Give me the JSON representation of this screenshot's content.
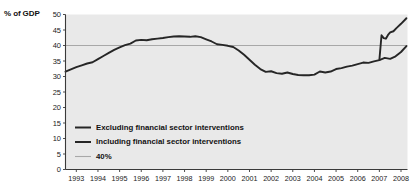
{
  "chart_data": {
    "type": "line",
    "title": "",
    "xlabel": "",
    "ylabel": "% of GDP",
    "ylim": [
      0,
      50
    ],
    "xlim": [
      1993,
      2008.8
    ],
    "grid": false,
    "legend_position": "inside-lower-left",
    "yticks": [
      0,
      5,
      10,
      15,
      20,
      25,
      30,
      35,
      40,
      45,
      50
    ],
    "categories": [
      "1993",
      "1994",
      "1995",
      "1996",
      "1997",
      "1998",
      "1999",
      "2000",
      "2001",
      "2002",
      "2003",
      "2004",
      "2005",
      "2006",
      "2007",
      "2008"
    ],
    "reference_line": {
      "label": "40%",
      "value": 40,
      "color": "#a8a8a8"
    },
    "series": [
      {
        "name": "Excluding financial sector interventions",
        "color": "#262626",
        "x": [
          1993.0,
          1993.25,
          1993.5,
          1993.75,
          1994.0,
          1994.25,
          1994.5,
          1994.75,
          1995.0,
          1995.25,
          1995.5,
          1995.75,
          1996.0,
          1996.25,
          1996.5,
          1996.75,
          1997.0,
          1997.25,
          1997.5,
          1997.75,
          1998.0,
          1998.25,
          1998.5,
          1998.75,
          1999.0,
          1999.25,
          1999.5,
          1999.75,
          2000.0,
          2000.25,
          2000.5,
          2000.75,
          2001.0,
          2001.25,
          2001.5,
          2001.75,
          2002.0,
          2002.25,
          2002.5,
          2002.75,
          2003.0,
          2003.25,
          2003.5,
          2003.75,
          2004.0,
          2004.25,
          2004.5,
          2004.75,
          2005.0,
          2005.25,
          2005.5,
          2005.75,
          2006.0,
          2006.25,
          2006.5,
          2006.75,
          2007.0,
          2007.25,
          2007.5,
          2007.75,
          2008.0,
          2008.25,
          2008.5,
          2008.75
        ],
        "y": [
          31.6,
          32.3,
          33.0,
          33.6,
          34.2,
          34.6,
          35.6,
          36.6,
          37.6,
          38.6,
          39.4,
          40.1,
          40.6,
          41.6,
          41.8,
          41.7,
          42.0,
          42.2,
          42.4,
          42.7,
          42.9,
          43.0,
          42.9,
          42.8,
          43.0,
          42.7,
          42.0,
          41.3,
          40.4,
          40.2,
          39.9,
          39.5,
          38.4,
          37.0,
          35.4,
          33.8,
          32.4,
          31.5,
          31.7,
          31.1,
          30.9,
          31.3,
          30.8,
          30.5,
          30.4,
          30.4,
          30.6,
          31.6,
          31.3,
          31.6,
          32.4,
          32.7,
          33.2,
          33.5,
          34.0,
          34.5,
          34.4,
          34.9,
          35.3,
          36.0,
          35.7,
          36.5,
          37.9,
          39.8
        ]
      },
      {
        "name": "Including financial sector interventions",
        "color": "#262626",
        "x": [
          2007.5,
          2007.6,
          2007.7,
          2007.8,
          2007.9,
          2008.0,
          2008.15,
          2008.3,
          2008.5,
          2008.75
        ],
        "y": [
          35.3,
          43.3,
          42.4,
          42.2,
          43.4,
          44.2,
          44.6,
          45.7,
          47.0,
          48.8
        ]
      }
    ]
  },
  "legend": {
    "items": [
      {
        "label": "Excluding financial sector interventions",
        "color": "#262626",
        "swatch": "thick-line"
      },
      {
        "label": "Including financial sector interventions",
        "color": "#262626",
        "swatch": "thick-line"
      },
      {
        "label": "40%",
        "color": "#a8a8a8",
        "swatch": "thin-line"
      }
    ]
  },
  "axis": {
    "y_title": "% of GDP"
  }
}
